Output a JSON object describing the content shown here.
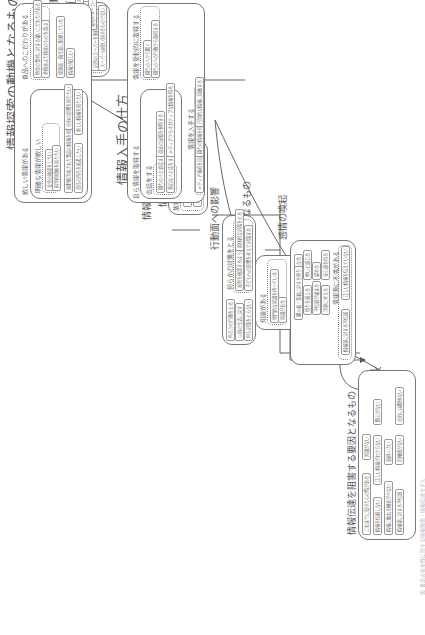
{
  "caption": "図 食品の安全性に関する情報探索・情報伝達モデル",
  "groups": {
    "daily": {
      "title": "日々の食品購買行動",
      "dotted_label": "特定のスーパーのみに限定した利用はしない",
      "dotted_items": [
        "特定のスーパーでない",
        "安さを求めてスーパーを使い分ける",
        "近所のスーパーを利用している",
        "スーパーは使い分けるものでない"
      ],
      "items": [
        "お気に入りのスーパーがある",
        "産地やメーカーを見て買い物する"
      ]
    },
    "recall": {
      "title": "情報を想起する手がかりとなるもの",
      "items": [
        "利用の高い日々の記憶",
        "食料品と食品安全性の情報への関心"
      ]
    },
    "source": {
      "title": "情報源となるもの",
      "dotted_label": "放射能と食品汚染に関する情報源",
      "items": [
        "人からの情報収集",
        "メディアからの情報収集"
      ]
    },
    "motive": {
      "title": "情報探索の動機となるもの",
      "want": {
        "label": "欲しい情報がある",
        "clear_label": "明確な情報が欲しい",
        "clear_items": [
          "安全の確認をしたい",
          "科学的根拠を知りたい"
        ],
        "items": [
          "放射能汚染された食品の情報を知りたい",
          "自分の影響を知りたい",
          "責任の所在を追及したい",
          "新しい情報を知りたい"
        ]
      },
      "food": {
        "label": "食品へのこだわりがある",
        "dotted_items": [
          "特定の食材に対する強いこだわりがある",
          "外国産より国産のものを選ぶ"
        ],
        "items": [
          "健康面・衛生面に配慮している",
          "情報が欲しい"
        ]
      }
    },
    "acquire": {
      "title": "情報入手の仕方",
      "self": {
        "label": "自ら情報を取得する",
        "talk_label": "会話をする",
        "talk_items": [
          "周りの人と会話する",
          "身近な人と話をする"
        ],
        "items": [
          "過去の記憶を参照する",
          "メディアからネガティブな情報を得る"
        ]
      },
      "passive": {
        "label": "情報を受動的に取得する",
        "items": [
          "周りの人から聞く",
          "周りの人の行動から取得する"
        ]
      },
      "get": {
        "label": "情報を入手する",
        "items": [
          "メディア報道を目にする",
          "周りの情報を得る",
          "日常的な情報に接触する"
        ]
      }
    },
    "promote": {
      "title": "情報伝達を促進する要因となるもの",
      "knowledge_label": "知識がある",
      "knowledge_items": [
        "専門的な知識を持っている",
        "知識がある"
      ],
      "items": [
        "人から得た情報を信頼する",
        "信頼できる情報源がある"
      ]
    },
    "inhibit": {
      "title": "情報伝達を阻害する要因となるもの",
      "items": [
        "これまでに受けた心の傷がある",
        "知識がない",
        "情報を信頼しない",
        "正しい情報がわからない",
        "関心がない",
        "情報に触れる機会が少ない",
        "面倒くさい",
        "情報源に対する不信感",
        "危機感がない",
        "自分には関係ない"
      ]
    },
    "behavior": {
      "title": "行動面への影響",
      "dotted_label": "何らかの対策をとる",
      "dotted_items": [
        "産地を確認するようになった",
        "具体的な対策をとる",
        "子どもへの影響を考えて対策する"
      ],
      "items": [
        "何らかの行動をとる",
        "以前の生活に戻す",
        "何も対策をとらない"
      ]
    },
    "emotion": {
      "title": "感情の喚起",
      "items": [
        "不安になる",
        "購入者・業者に対する怒り",
        "怖いと感じる",
        "憤りを感じる",
        "諦める",
        "不信感が強まる",
        "安心感を得る",
        "冷静に考える"
      ],
      "dotted_label": "情報源に不満がある",
      "dotted_items": [
        "正しい情報を伝えていない",
        "情報源に対する不信感"
      ]
    }
  }
}
